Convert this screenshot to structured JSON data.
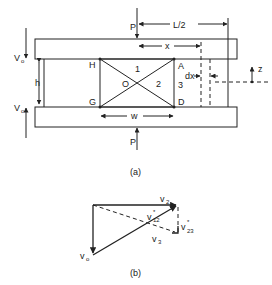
{
  "figure_a": {
    "caption": "(a)",
    "labels": {
      "load_top": "P",
      "load_bottom": "P",
      "half_span": "L/2",
      "x": "x",
      "dx": "dx",
      "z": "z",
      "h": "h",
      "w": "w",
      "shear_top": "V",
      "shear_top_sub": "o",
      "shear_bottom": "V",
      "shear_bottom_sub": "o",
      "node_H": "H",
      "node_G": "G",
      "node_A": "A",
      "node_D": "D",
      "node_O": "O",
      "region_1": "1",
      "region_2": "2",
      "region_3": "3"
    }
  },
  "figure_b": {
    "caption": "(b)",
    "labels": {
      "v2": "v",
      "v2_sub": "2",
      "v12": "v",
      "v12_sup": "*",
      "v12_sub": "12",
      "v23": "v",
      "v23_sup": "*",
      "v23_sub": "23",
      "v3": "v",
      "v3_sub": "3",
      "vo": "v",
      "vo_sub": "o"
    }
  }
}
